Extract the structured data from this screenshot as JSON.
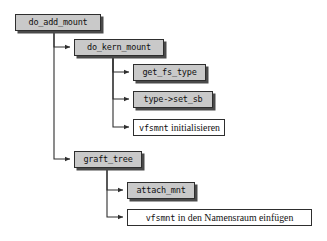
{
  "diagram": {
    "title_text": "",
    "type": "call-hierarchy-tree",
    "language": "de",
    "colors": {
      "background": "#ffffff",
      "box_fill_filled": "#c9c9c9",
      "box_fill_plain": "#ffffff",
      "box_border": "#2e2e2e",
      "box_shadow": "#4a4a4a",
      "edge": "#2e2e2e",
      "text": "#101010"
    },
    "nodes": [
      {
        "id": "do_add_mount",
        "label": "do_add_mount",
        "style": "filled",
        "x": 15,
        "y": 14,
        "w": 86,
        "level": 0
      },
      {
        "id": "do_kern_mount",
        "label": "do_kern_mount",
        "style": "filled",
        "x": 74,
        "y": 39,
        "w": 90,
        "level": 1
      },
      {
        "id": "get_fs_type",
        "label": "get_fs_type",
        "style": "filled",
        "x": 133,
        "y": 64,
        "w": 73,
        "level": 2
      },
      {
        "id": "type_set_sb",
        "label": "type->set_sb",
        "style": "filled",
        "x": 133,
        "y": 91,
        "w": 80,
        "level": 2
      },
      {
        "id": "vfsmnt_init",
        "label_mono": "vfsmnt",
        "label_rest": " initialisieren",
        "label": "vfsmnt initialisieren",
        "style": "plain",
        "x": 133,
        "y": 119,
        "w": 92,
        "level": 2
      },
      {
        "id": "graft_tree",
        "label": "graft_tree",
        "style": "filled",
        "x": 74,
        "y": 151,
        "w": 68,
        "level": 1
      },
      {
        "id": "attach_mnt",
        "label": "attach_mnt",
        "style": "filled",
        "x": 127,
        "y": 182,
        "w": 68,
        "level": 2
      },
      {
        "id": "vfsmnt_namensraum",
        "label_mono": "vfsmnt",
        "label_rest": " in den Namensraum einfügen",
        "label": "vfsmnt in den Namensraum einfügen",
        "style": "plain",
        "x": 127,
        "y": 209,
        "w": 185,
        "level": 2
      }
    ],
    "edges": [
      {
        "from": "do_add_mount",
        "to": "do_kern_mount"
      },
      {
        "from": "do_add_mount",
        "to": "graft_tree"
      },
      {
        "from": "do_kern_mount",
        "to": "get_fs_type"
      },
      {
        "from": "do_kern_mount",
        "to": "type_set_sb"
      },
      {
        "from": "do_kern_mount",
        "to": "vfsmnt_init"
      },
      {
        "from": "graft_tree",
        "to": "attach_mnt"
      },
      {
        "from": "graft_tree",
        "to": "vfsmnt_namensraum"
      }
    ]
  }
}
